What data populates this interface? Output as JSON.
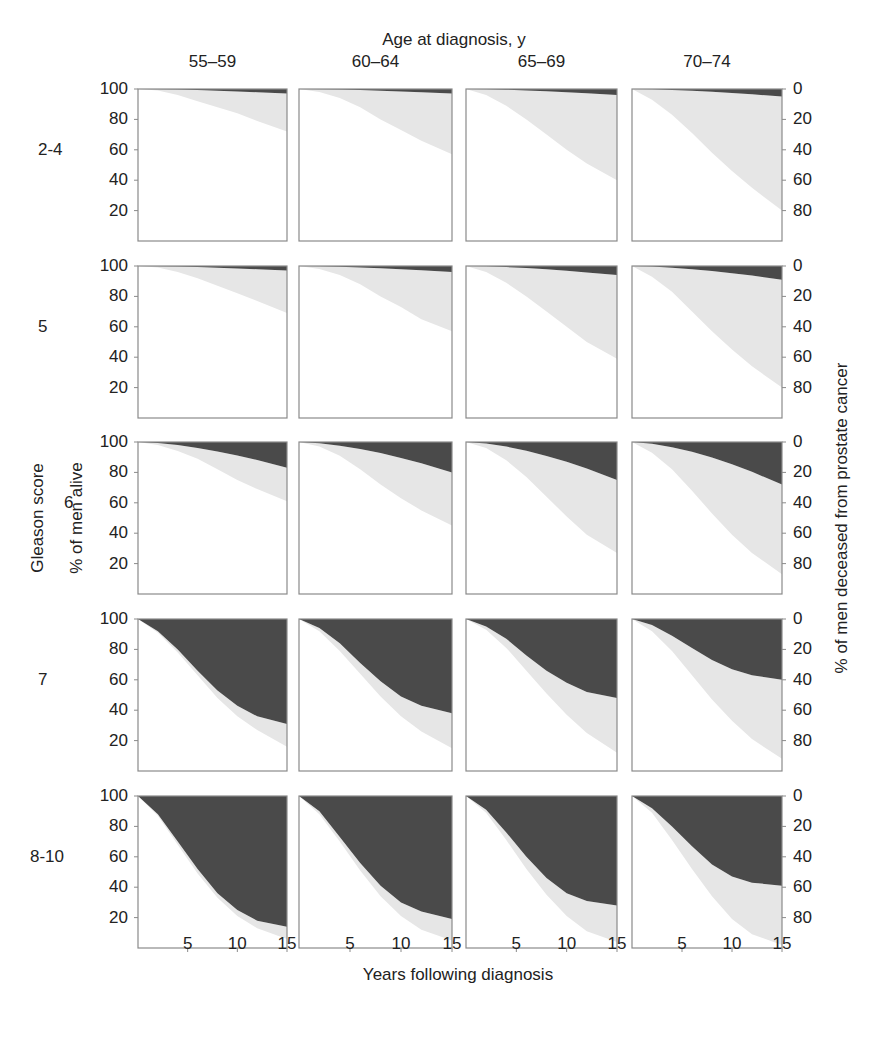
{
  "chart_data": {
    "type": "area",
    "title": "Age at diagnosis, y",
    "xlabel": "Years following diagnosis",
    "ylabel_left": "% of men alive",
    "ylabel_right": "% of men deceased from prostate cancer",
    "row_group_label": "Gleason score",
    "columns": [
      "55–59",
      "60–64",
      "65–69",
      "70–74"
    ],
    "rows": [
      "2-4",
      "5",
      "6",
      "7",
      "8-10"
    ],
    "x_ticks": [
      5,
      10,
      15
    ],
    "xlim": [
      0,
      15
    ],
    "y_ticks_left": [
      100,
      80,
      60,
      40,
      20
    ],
    "y_ticks_right": [
      0,
      20,
      40,
      60,
      80
    ],
    "ylim": [
      0,
      100
    ],
    "legend": {
      "dark": "Died of prostate cancer",
      "light": "Died of other causes",
      "white": "Alive"
    },
    "colors": {
      "dark": "#4a4a4a",
      "light": "#e6e6e6",
      "white": "#ffffff",
      "frame": "#8a8a8a"
    },
    "x": [
      0,
      2,
      4,
      6,
      8,
      10,
      12,
      15
    ],
    "panels": [
      {
        "row": "2-4",
        "col": "55–59",
        "cancer_death_pct_at_15": 3,
        "alive_pct": [
          100,
          99,
          96,
          92,
          88,
          84,
          79,
          72
        ]
      },
      {
        "row": "2-4",
        "col": "60–64",
        "cancer_death_pct_at_15": 3,
        "alive_pct": [
          100,
          98,
          94,
          88,
          80,
          73,
          66,
          57
        ]
      },
      {
        "row": "2-4",
        "col": "65–69",
        "cancer_death_pct_at_15": 4,
        "alive_pct": [
          100,
          96,
          89,
          80,
          70,
          60,
          51,
          40
        ]
      },
      {
        "row": "2-4",
        "col": "70–74",
        "cancer_death_pct_at_15": 5,
        "alive_pct": [
          100,
          93,
          83,
          71,
          58,
          46,
          35,
          20
        ]
      },
      {
        "row": "5",
        "col": "55–59",
        "cancer_death_pct_at_15": 3,
        "alive_pct": [
          100,
          99,
          96,
          92,
          87,
          82,
          77,
          69
        ]
      },
      {
        "row": "5",
        "col": "60–64",
        "cancer_death_pct_at_15": 4,
        "alive_pct": [
          100,
          98,
          94,
          88,
          80,
          73,
          65,
          57
        ]
      },
      {
        "row": "5",
        "col": "65–69",
        "cancer_death_pct_at_15": 6,
        "alive_pct": [
          100,
          96,
          89,
          80,
          70,
          60,
          50,
          39
        ]
      },
      {
        "row": "5",
        "col": "70–74",
        "cancer_death_pct_at_15": 9,
        "alive_pct": [
          100,
          93,
          83,
          70,
          57,
          45,
          34,
          20
        ]
      },
      {
        "row": "6",
        "col": "55–59",
        "cancer_death_pct_at_15": 17,
        "alive_pct": [
          100,
          98,
          94,
          89,
          82,
          75,
          69,
          61
        ]
      },
      {
        "row": "6",
        "col": "60–64",
        "cancer_death_pct_at_15": 20,
        "alive_pct": [
          100,
          97,
          91,
          82,
          72,
          63,
          55,
          45
        ]
      },
      {
        "row": "6",
        "col": "65–69",
        "cancer_death_pct_at_15": 25,
        "alive_pct": [
          100,
          96,
          88,
          77,
          64,
          51,
          39,
          27
        ]
      },
      {
        "row": "6",
        "col": "70–74",
        "cancer_death_pct_at_15": 28,
        "alive_pct": [
          100,
          93,
          82,
          68,
          53,
          39,
          27,
          13
        ]
      },
      {
        "row": "7",
        "col": "55–59",
        "cancer_death_pct_at_15": 70,
        "cancer_curve": [
          100,
          92,
          80,
          66,
          53,
          43,
          36,
          31
        ],
        "alive_pct": [
          100,
          91,
          78,
          63,
          48,
          36,
          27,
          16
        ]
      },
      {
        "row": "7",
        "col": "60–64",
        "cancer_death_pct_at_15": 62,
        "cancer_curve": [
          100,
          94,
          84,
          71,
          59,
          49,
          43,
          38
        ],
        "alive_pct": [
          100,
          92,
          79,
          64,
          49,
          36,
          26,
          15
        ]
      },
      {
        "row": "7",
        "col": "65–69",
        "cancer_death_pct_at_15": 52,
        "cancer_curve": [
          100,
          95,
          87,
          76,
          66,
          58,
          52,
          48
        ],
        "alive_pct": [
          100,
          93,
          81,
          66,
          51,
          37,
          25,
          12
        ]
      },
      {
        "row": "7",
        "col": "70–74",
        "cancer_death_pct_at_15": 40,
        "cancer_curve": [
          100,
          96,
          89,
          81,
          73,
          67,
          63,
          60
        ],
        "alive_pct": [
          100,
          92,
          79,
          63,
          47,
          33,
          21,
          8
        ]
      },
      {
        "row": "8-10",
        "col": "55–59",
        "cancer_death_pct_at_15": 86,
        "cancer_curve": [
          100,
          88,
          70,
          52,
          36,
          25,
          18,
          14
        ],
        "alive_pct": [
          100,
          87,
          68,
          49,
          33,
          21,
          13,
          6
        ]
      },
      {
        "row": "8-10",
        "col": "60–64",
        "cancer_death_pct_at_15": 80,
        "cancer_curve": [
          100,
          90,
          73,
          56,
          41,
          30,
          24,
          19
        ],
        "alive_pct": [
          100,
          88,
          70,
          51,
          34,
          21,
          12,
          5
        ]
      },
      {
        "row": "8-10",
        "col": "65–69",
        "cancer_death_pct_at_15": 71,
        "cancer_curve": [
          100,
          91,
          76,
          60,
          46,
          36,
          31,
          28
        ],
        "alive_pct": [
          100,
          89,
          71,
          52,
          35,
          21,
          11,
          4
        ]
      },
      {
        "row": "8-10",
        "col": "70–74",
        "cancer_death_pct_at_15": 58,
        "cancer_curve": [
          100,
          92,
          80,
          67,
          55,
          47,
          43,
          41
        ],
        "alive_pct": [
          100,
          89,
          71,
          52,
          34,
          19,
          9,
          2
        ]
      }
    ]
  },
  "labels": {
    "title": "Age at diagnosis, y",
    "xlabel": "Years following diagnosis",
    "ylabel_left": "% of men alive",
    "ylabel_right": "% of men deceased from prostate cancer",
    "row_group": "Gleason score"
  }
}
